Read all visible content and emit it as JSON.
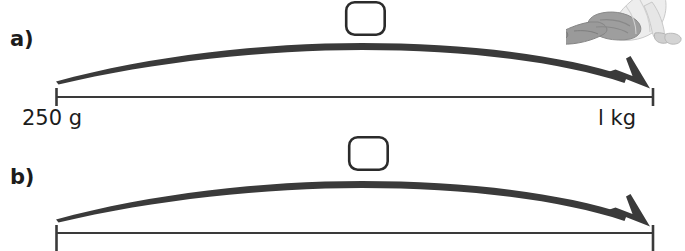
{
  "figure": {
    "type": "physics-force-arrow-diagram",
    "width": 685,
    "height": 251,
    "background_color": "#ffffff",
    "stroke_color": "#3a3a3a",
    "text_color": "#1c1c1c"
  },
  "panels": [
    {
      "id": "a",
      "letter": "a)",
      "arc": {
        "start_x": 56,
        "start_y": 81,
        "apex_x": 360,
        "apex_y": 43,
        "end_x": 650,
        "end_y": 86,
        "has_arrowhead": true,
        "arrow_direction": "left-to-right",
        "max_stroke_width": 6.5
      },
      "axis": {
        "baseline_y": 97,
        "left_tick_x": 56,
        "right_tick_x": 653,
        "tick_top": 88,
        "tick_bottom": 106,
        "line_width": 2
      },
      "box": {
        "x": 345,
        "y": 1,
        "width": 40,
        "height": 34,
        "corner_radius": 8,
        "fill": "#ffffff",
        "stroke": "#2b2b2b",
        "stroke_width": 2.5,
        "content": ""
      },
      "labels": {
        "left": "250 g",
        "right": "l kg"
      }
    },
    {
      "id": "b",
      "letter": "b)",
      "arc": {
        "start_x": 56,
        "start_y": 219,
        "apex_x": 360,
        "apex_y": 181,
        "end_x": 650,
        "end_y": 224,
        "has_arrowhead": true,
        "arrow_direction": "left-to-right",
        "max_stroke_width": 6.5
      },
      "axis": {
        "baseline_y": 233,
        "left_tick_x": 56,
        "right_tick_x": 653,
        "tick_top": 225,
        "tick_bottom": 251,
        "line_width": 2
      },
      "box": {
        "x": 348,
        "y": 136,
        "width": 40,
        "height": 34,
        "corner_radius": 8,
        "fill": "#ffffff",
        "stroke": "#2b2b2b",
        "stroke_width": 2.5,
        "content": ""
      },
      "labels": {
        "left": "",
        "right": ""
      }
    }
  ],
  "illustration": {
    "name": "person-sitting-stretching",
    "description": "grayscale clip-art of a seated person leaning forward, cropped by the top-right corner",
    "x": 568,
    "y": 0,
    "width": 117,
    "height": 46,
    "palette": {
      "shoe_dark": "#6e6e6e",
      "sock_mid": "#8d8d8d",
      "trouser": "#9a9a9a",
      "shirt_light": "#e3e3e3",
      "skin": "#cfcfcf",
      "outline": "#b5b5b5"
    }
  }
}
